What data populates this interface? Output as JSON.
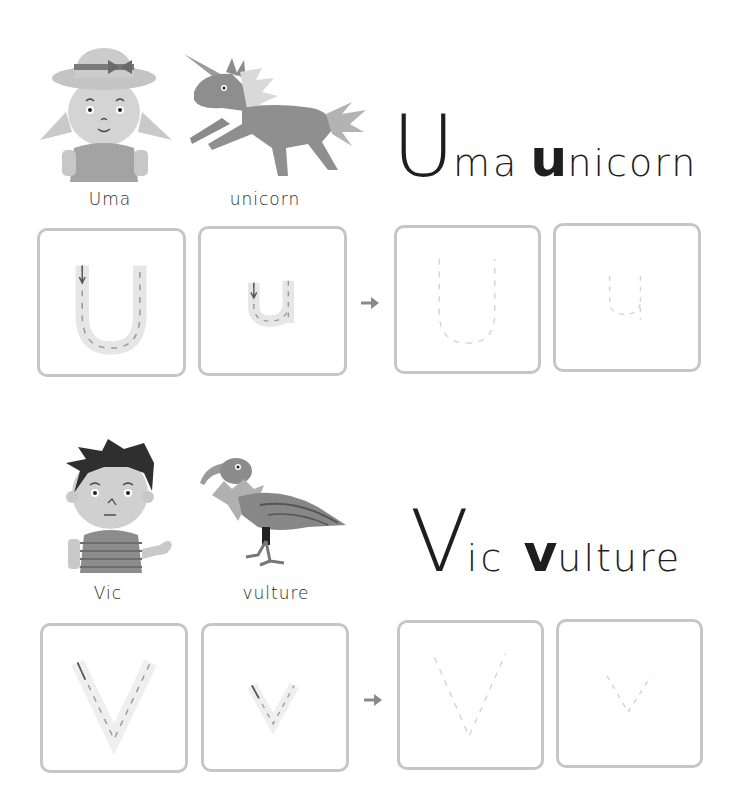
{
  "sections": [
    {
      "letter": "U",
      "heading": {
        "big": "U",
        "rest1": "ma",
        "med": "u",
        "rest2": "nicorn"
      },
      "captions": {
        "person": "Uma",
        "animal": "unicorn"
      },
      "illustrations": {
        "person": "girl-with-hat-icon",
        "animal": "unicorn-icon"
      },
      "tracing_boxes": [
        {
          "type": "guided-uppercase",
          "glyph": "U"
        },
        {
          "type": "guided-lowercase",
          "glyph": "u"
        },
        {
          "type": "practice-uppercase",
          "glyph": "U"
        },
        {
          "type": "practice-lowercase",
          "glyph": "u"
        }
      ]
    },
    {
      "letter": "V",
      "heading": {
        "big": "V",
        "rest1": "ic",
        "med": "v",
        "rest2": "ulture"
      },
      "captions": {
        "person": "Vic",
        "animal": "vulture"
      },
      "illustrations": {
        "person": "boy-icon",
        "animal": "vulture-icon"
      },
      "tracing_boxes": [
        {
          "type": "guided-uppercase",
          "glyph": "V"
        },
        {
          "type": "guided-lowercase",
          "glyph": "v"
        },
        {
          "type": "practice-uppercase",
          "glyph": "V"
        },
        {
          "type": "practice-lowercase",
          "glyph": "v"
        }
      ]
    }
  ],
  "colors": {
    "box_border": "#c6c6c6",
    "trace_fill": "#e6e6e6",
    "dash": "#9a9a9a",
    "faint_dash": "#d2d2d2",
    "arrow": "#8a8a8a",
    "text": "#1e1e1e"
  }
}
